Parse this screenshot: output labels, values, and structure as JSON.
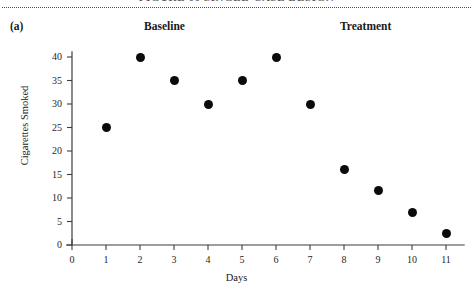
{
  "figure": {
    "panel_label": "(a)",
    "cut_off_header": "FIGURE 00  SINGLE-CASE DESIGN",
    "phase_labels": [
      {
        "name": "baseline",
        "text": "Baseline"
      },
      {
        "name": "treatment",
        "text": "Treatment"
      }
    ]
  },
  "chart_data": {
    "type": "scatter",
    "title": "",
    "xlabel": "Days",
    "ylabel": "Cigarettes Smoked",
    "xlim": [
      0,
      11.6
    ],
    "ylim": [
      0,
      41
    ],
    "grid": false,
    "legend_position": "none",
    "xticks": [
      0,
      1,
      2,
      3,
      4,
      5,
      6,
      7,
      8,
      9,
      10,
      11
    ],
    "xtick_labels": [
      "0",
      "1",
      "2",
      "3",
      "4",
      "5",
      "6",
      "7",
      "8",
      "9",
      "10",
      "11"
    ],
    "yticks": [
      0,
      5,
      10,
      15,
      20,
      25,
      30,
      35,
      40
    ],
    "ytick_labels": [
      "0",
      "5",
      "10",
      "15",
      "20",
      "25",
      "30",
      "35",
      "40"
    ],
    "marker": "filled-circle",
    "marker_color": "#0b0b0b",
    "x": [
      1,
      2,
      3,
      4,
      5,
      6,
      7,
      8,
      9,
      10,
      11
    ],
    "values": [
      25,
      40,
      35,
      30,
      35,
      40,
      30,
      16,
      11.5,
      7,
      2.5
    ],
    "annotations": [
      {
        "text": "Baseline",
        "x": 3.0,
        "phase_range": [
          1,
          6
        ]
      },
      {
        "text": "Treatment",
        "x": 8.6,
        "phase_range": [
          7,
          11
        ]
      }
    ]
  }
}
